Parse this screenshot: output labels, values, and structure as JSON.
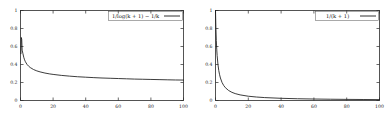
{
  "figure": {
    "panel_count": 2,
    "background_color": "#ffffff",
    "curve_color": "#1a1a1a",
    "axis_color": "#2a2a2a"
  },
  "chart_data": [
    {
      "type": "line",
      "title": "",
      "xlabel": "",
      "ylabel": "",
      "xlim": [
        0,
        100
      ],
      "ylim": [
        0,
        1
      ],
      "grid": false,
      "legend_position": "top-right",
      "xticks": [
        "0",
        "20",
        "40",
        "60",
        "80",
        "100"
      ],
      "xtick_values": [
        0,
        20,
        40,
        60,
        80,
        100
      ],
      "yticks": [
        "0",
        "0.2",
        "0.4",
        "0.6",
        "0.8",
        "1"
      ],
      "ytick_values": [
        0,
        0.2,
        0.4,
        0.6,
        0.8,
        1
      ],
      "series": [
        {
          "name": "1/log(k + 1) − 1/k",
          "x": [
            0.25,
            0.5,
            0.75,
            1,
            1.5,
            2,
            2.5,
            3,
            4,
            5,
            6,
            8,
            10,
            12,
            15,
            18,
            20,
            25,
            30,
            35,
            40,
            45,
            50,
            55,
            60,
            65,
            70,
            75,
            80,
            85,
            90,
            95,
            100
          ],
          "values": [
            0.52,
            0.7,
            0.68,
            0.56,
            0.52,
            0.48,
            0.452,
            0.431,
            0.401,
            0.381,
            0.366,
            0.344,
            0.329,
            0.318,
            0.305,
            0.295,
            0.29,
            0.279,
            0.271,
            0.264,
            0.259,
            0.254,
            0.25,
            0.247,
            0.244,
            0.241,
            0.238,
            0.236,
            0.234,
            0.232,
            0.23,
            0.228,
            0.227
          ]
        }
      ]
    },
    {
      "type": "line",
      "title": "",
      "xlabel": "",
      "ylabel": "",
      "xlim": [
        0,
        100
      ],
      "ylim": [
        0,
        1
      ],
      "grid": false,
      "legend_position": "top-right",
      "xticks": [
        "0",
        "20",
        "40",
        "60",
        "80",
        "100"
      ],
      "xtick_values": [
        0,
        20,
        40,
        60,
        80,
        100
      ],
      "yticks": [
        "0",
        "0.2",
        "0.4",
        "0.6",
        "0.8",
        "1"
      ],
      "ytick_values": [
        0,
        0.2,
        0.4,
        0.6,
        0.8,
        1
      ],
      "series": [
        {
          "name": "1/(k + 1)",
          "x": [
            0,
            0.25,
            0.5,
            0.75,
            1,
            1.5,
            2,
            2.5,
            3,
            4,
            5,
            6,
            8,
            10,
            12,
            15,
            20,
            25,
            30,
            40,
            50,
            60,
            70,
            80,
            90,
            100
          ],
          "values": [
            1,
            0.8,
            0.667,
            0.571,
            0.5,
            0.4,
            0.333,
            0.286,
            0.25,
            0.2,
            0.167,
            0.143,
            0.111,
            0.0909,
            0.0769,
            0.0625,
            0.0476,
            0.0385,
            0.0323,
            0.0244,
            0.0196,
            0.0164,
            0.0141,
            0.0123,
            0.011,
            0.0099
          ]
        }
      ]
    }
  ]
}
